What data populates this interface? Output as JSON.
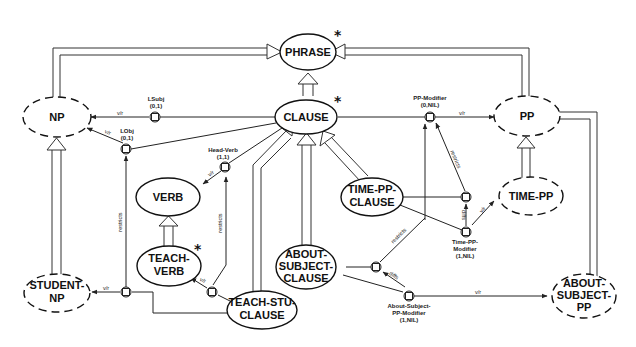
{
  "diagram": {
    "type": "KL-ONE semantic network",
    "nodes": {
      "phrase": {
        "label": "PHRASE",
        "starred": true,
        "style": "solid"
      },
      "clause": {
        "label": "CLAUSE",
        "starred": true,
        "style": "solid"
      },
      "np": {
        "label": "NP",
        "style": "dashed"
      },
      "pp": {
        "label": "PP",
        "style": "dashed"
      },
      "verb": {
        "label": "VERB",
        "style": "solid"
      },
      "teach_verb": {
        "line1": "TEACH-",
        "line2": "VERB",
        "starred": true,
        "style": "solid"
      },
      "time_pp_clause": {
        "line1": "TIME-PP-",
        "line2": "CLAUSE",
        "style": "solid"
      },
      "time_pp": {
        "label": "TIME-PP",
        "style": "dashed"
      },
      "about_subject_clause": {
        "line1": "ABOUT-",
        "line2": "SUBJECT-",
        "line3": "CLAUSE",
        "style": "solid"
      },
      "student_np": {
        "line1": "STUDENT-",
        "line2": "NP",
        "style": "dashed"
      },
      "teach_stu_clause": {
        "line1": "TEACH-STU-",
        "line2": "CLAUSE",
        "style": "solid"
      },
      "about_subject_pp": {
        "line1": "ABOUT-",
        "line2": "SUBJECT-",
        "line3": "PP",
        "style": "dashed"
      }
    },
    "roles": {
      "lsubj": {
        "name": "LSubj",
        "card": "(0,1)"
      },
      "lobj": {
        "name": "LObj",
        "card": "(0,1)"
      },
      "head_verb": {
        "name": "Head-Verb",
        "card": "(1,1)"
      },
      "pp_modifier": {
        "name": "PP-Modifier",
        "card": "(0,NIL)"
      },
      "time_pp_modifier": {
        "line1": "Time-PP-",
        "line2": "Modifier",
        "card": "(1,NIL)"
      },
      "about_subject_pp_modifier": {
        "line1": "About-Subject-",
        "line2": "PP-Modifier",
        "card": "(1,NIL)"
      }
    },
    "edge_labels": {
      "vr": "v/r",
      "restricts": "restricts",
      "diffs": "diffs"
    },
    "star": "*"
  }
}
